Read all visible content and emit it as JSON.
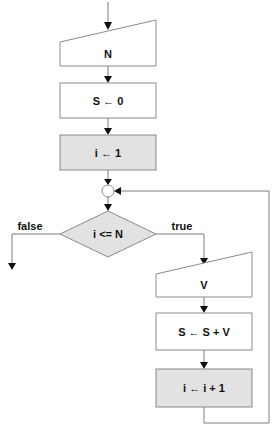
{
  "diagram": {
    "type": "flowchart",
    "nodes": [
      {
        "id": "input_n",
        "kind": "manual-input",
        "label": "N"
      },
      {
        "id": "init_s",
        "kind": "process",
        "label": "S ← 0"
      },
      {
        "id": "init_i",
        "kind": "process-shaded",
        "label": "i ← 1"
      },
      {
        "id": "junction",
        "kind": "connector",
        "label": ""
      },
      {
        "id": "cond",
        "kind": "decision",
        "label": "i <= N"
      },
      {
        "id": "input_v",
        "kind": "manual-input",
        "label": "V"
      },
      {
        "id": "accum",
        "kind": "process",
        "label": "S ← S + V"
      },
      {
        "id": "incr",
        "kind": "process-shaded",
        "label": "i ← i + 1"
      }
    ],
    "edges": [
      {
        "from": "start",
        "to": "input_n",
        "label": ""
      },
      {
        "from": "input_n",
        "to": "init_s",
        "label": ""
      },
      {
        "from": "init_s",
        "to": "init_i",
        "label": ""
      },
      {
        "from": "init_i",
        "to": "junction",
        "label": ""
      },
      {
        "from": "junction",
        "to": "cond",
        "label": ""
      },
      {
        "from": "cond",
        "to": "exit",
        "label": "false"
      },
      {
        "from": "cond",
        "to": "input_v",
        "label": "true"
      },
      {
        "from": "input_v",
        "to": "accum",
        "label": ""
      },
      {
        "from": "accum",
        "to": "incr",
        "label": ""
      },
      {
        "from": "incr",
        "to": "junction",
        "label": ""
      }
    ],
    "colors": {
      "shaded_fill": "#e2e2e2",
      "stroke": "#8a8a8a",
      "text": "#111111"
    }
  }
}
